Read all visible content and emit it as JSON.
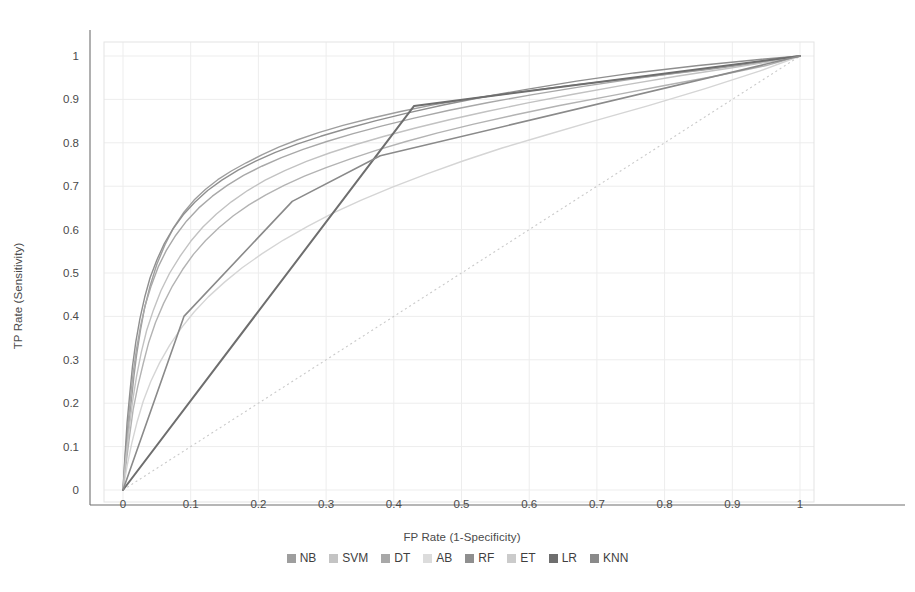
{
  "chart_data": {
    "type": "line",
    "title": "",
    "subtitle": "",
    "xlabel": "FP Rate (1-Specificity)",
    "ylabel": "TP Rate (Sensitivity)",
    "xlim": [
      0,
      1
    ],
    "ylim": [
      0,
      1
    ],
    "grid": true,
    "legend_position": "bottom",
    "xticks": [
      "0",
      "0.1",
      "0.2",
      "0.3",
      "0.4",
      "0.5",
      "0.6",
      "0.7",
      "0.8",
      "0.9",
      "1"
    ],
    "xtick_values": [
      0,
      0.1,
      0.2,
      0.3,
      0.4,
      0.5,
      0.6,
      0.7,
      0.8,
      0.9,
      1
    ],
    "yticks": [
      "0",
      "0.1",
      "0.2",
      "0.3",
      "0.4",
      "0.5",
      "0.6",
      "0.7",
      "0.8",
      "0.9",
      "1"
    ],
    "ytick_values": [
      0,
      0.1,
      0.2,
      0.3,
      0.4,
      0.5,
      0.6,
      0.7,
      0.8,
      0.9,
      1
    ],
    "reference_line": {
      "name": "chance-diagonal",
      "style": "dotted",
      "color": "#c9c9c9",
      "x": [
        0,
        1
      ],
      "y": [
        0,
        1
      ]
    },
    "series": [
      {
        "name": "NB",
        "color": "#9e9e9e",
        "width": 1.4,
        "x": [
          0,
          0.004,
          0.008,
          0.012,
          0.016,
          0.02,
          0.026,
          0.032,
          0.04,
          0.05,
          0.062,
          0.075,
          0.09,
          0.105,
          0.122,
          0.14,
          0.16,
          0.182,
          0.205,
          0.23,
          0.258,
          0.29,
          0.325,
          0.365,
          0.41,
          0.46,
          0.52,
          0.59,
          0.67,
          0.76,
          0.86,
          0.93,
          1
        ],
        "y": [
          0,
          0.07,
          0.14,
          0.2,
          0.26,
          0.31,
          0.37,
          0.42,
          0.47,
          0.52,
          0.565,
          0.605,
          0.64,
          0.668,
          0.693,
          0.715,
          0.735,
          0.754,
          0.772,
          0.79,
          0.807,
          0.824,
          0.84,
          0.856,
          0.872,
          0.888,
          0.903,
          0.918,
          0.934,
          0.95,
          0.968,
          0.982,
          1
        ]
      },
      {
        "name": "SVM",
        "color": "#b3b3b3",
        "width": 1.4,
        "x": [
          0,
          0.005,
          0.01,
          0.015,
          0.022,
          0.03,
          0.038,
          0.048,
          0.06,
          0.073,
          0.088,
          0.104,
          0.122,
          0.142,
          0.163,
          0.186,
          0.211,
          0.238,
          0.268,
          0.3,
          0.336,
          0.375,
          0.418,
          0.465,
          0.518,
          0.578,
          0.645,
          0.72,
          0.8,
          0.88,
          0.95,
          1
        ],
        "y": [
          0,
          0.065,
          0.128,
          0.185,
          0.24,
          0.292,
          0.34,
          0.386,
          0.43,
          0.47,
          0.508,
          0.543,
          0.575,
          0.605,
          0.632,
          0.657,
          0.68,
          0.702,
          0.723,
          0.743,
          0.763,
          0.783,
          0.803,
          0.823,
          0.843,
          0.864,
          0.886,
          0.908,
          0.932,
          0.955,
          0.978,
          1
        ]
      },
      {
        "name": "DT",
        "color": "#a8a8a8",
        "width": 1.4,
        "x": [
          0,
          0.003,
          0.007,
          0.011,
          0.015,
          0.02,
          0.026,
          0.033,
          0.042,
          0.052,
          0.064,
          0.078,
          0.094,
          0.112,
          0.132,
          0.154,
          0.178,
          0.205,
          0.234,
          0.266,
          0.301,
          0.34,
          0.383,
          0.43,
          0.482,
          0.54,
          0.605,
          0.68,
          0.765,
          0.86,
          0.94,
          1
        ],
        "y": [
          0,
          0.075,
          0.145,
          0.21,
          0.27,
          0.325,
          0.378,
          0.427,
          0.472,
          0.514,
          0.552,
          0.587,
          0.62,
          0.65,
          0.677,
          0.702,
          0.725,
          0.746,
          0.766,
          0.785,
          0.803,
          0.821,
          0.839,
          0.857,
          0.875,
          0.893,
          0.911,
          0.93,
          0.95,
          0.97,
          0.987,
          1
        ]
      },
      {
        "name": "AB",
        "color": "#d5d5d5",
        "width": 1.4,
        "x": [
          0,
          0.006,
          0.013,
          0.021,
          0.03,
          0.041,
          0.054,
          0.069,
          0.086,
          0.105,
          0.126,
          0.15,
          0.176,
          0.205,
          0.237,
          0.272,
          0.31,
          0.352,
          0.398,
          0.448,
          0.502,
          0.56,
          0.625,
          0.695,
          0.775,
          0.86,
          0.94,
          1
        ],
        "y": [
          0,
          0.055,
          0.108,
          0.158,
          0.205,
          0.25,
          0.293,
          0.334,
          0.373,
          0.41,
          0.445,
          0.479,
          0.512,
          0.544,
          0.576,
          0.607,
          0.638,
          0.668,
          0.698,
          0.728,
          0.758,
          0.788,
          0.818,
          0.85,
          0.885,
          0.925,
          0.965,
          1
        ]
      },
      {
        "name": "RF",
        "color": "#8f8f8f",
        "width": 1.4,
        "x": [
          0,
          0.003,
          0.006,
          0.01,
          0.014,
          0.019,
          0.025,
          0.032,
          0.04,
          0.05,
          0.061,
          0.074,
          0.089,
          0.106,
          0.125,
          0.146,
          0.17,
          0.196,
          0.225,
          0.257,
          0.292,
          0.331,
          0.374,
          0.421,
          0.473,
          0.53,
          0.596,
          0.67,
          0.755,
          0.85,
          0.94,
          1
        ],
        "y": [
          0,
          0.08,
          0.155,
          0.222,
          0.285,
          0.342,
          0.395,
          0.444,
          0.489,
          0.53,
          0.568,
          0.602,
          0.634,
          0.663,
          0.69,
          0.714,
          0.737,
          0.758,
          0.778,
          0.797,
          0.815,
          0.833,
          0.851,
          0.869,
          0.887,
          0.905,
          0.923,
          0.942,
          0.961,
          0.978,
          0.992,
          1
        ]
      },
      {
        "name": "ET",
        "color": "#c2c2c2",
        "width": 1.4,
        "x": [
          0,
          0.004,
          0.009,
          0.014,
          0.02,
          0.027,
          0.035,
          0.045,
          0.056,
          0.069,
          0.084,
          0.1,
          0.118,
          0.138,
          0.16,
          0.184,
          0.21,
          0.239,
          0.271,
          0.306,
          0.344,
          0.386,
          0.432,
          0.482,
          0.537,
          0.598,
          0.665,
          0.74,
          0.82,
          0.9,
          0.96,
          1
        ],
        "y": [
          0,
          0.072,
          0.14,
          0.203,
          0.262,
          0.317,
          0.368,
          0.415,
          0.459,
          0.5,
          0.538,
          0.573,
          0.606,
          0.636,
          0.664,
          0.69,
          0.714,
          0.736,
          0.757,
          0.777,
          0.796,
          0.815,
          0.834,
          0.853,
          0.872,
          0.892,
          0.912,
          0.933,
          0.954,
          0.973,
          0.988,
          1
        ]
      },
      {
        "name": "LR",
        "color": "#6e6e6e",
        "width": 2.0,
        "x": [
          0,
          0.43,
          1
        ],
        "y": [
          0,
          0.885,
          1
        ]
      },
      {
        "name": "KNN",
        "color": "#8a8a8a",
        "width": 1.6,
        "x": [
          0,
          0.09,
          0.25,
          0.38,
          1
        ],
        "y": [
          0,
          0.4,
          0.665,
          0.77,
          1
        ]
      }
    ]
  },
  "legend": {
    "items": [
      {
        "label": "NB",
        "color": "#9e9e9e"
      },
      {
        "label": "SVM",
        "color": "#c4c4c4"
      },
      {
        "label": "DT",
        "color": "#a8a8a8"
      },
      {
        "label": "AB",
        "color": "#dcdcdc"
      },
      {
        "label": "RF",
        "color": "#8f8f8f"
      },
      {
        "label": "ET",
        "color": "#cbcbcb"
      },
      {
        "label": "LR",
        "color": "#6e6e6e"
      },
      {
        "label": "KNN",
        "color": "#8a8a8a"
      }
    ]
  }
}
